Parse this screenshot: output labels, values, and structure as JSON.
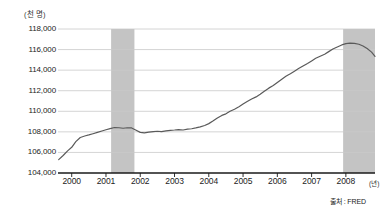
{
  "chart_data": {
    "type": "line",
    "title": "",
    "subtitle": "",
    "xlabel": "(년)",
    "ylabel": "(천 명)",
    "unit_label": "(천 명)",
    "x_unit_label": "(년)",
    "source_label": "출처 : FRED",
    "grid": true,
    "legend": false,
    "legend_position": "none",
    "xlim": [
      1999.6,
      2008.85
    ],
    "ylim": [
      104000,
      118000
    ],
    "y_ticks": [
      104000,
      106000,
      108000,
      110000,
      112000,
      114000,
      116000,
      118000
    ],
    "y_tick_labels": [
      "104,000",
      "106,000",
      "108,000",
      "110,000",
      "112,000",
      "114,000",
      "116,000",
      "118,000"
    ],
    "x_ticks": [
      2000,
      2001,
      2002,
      2003,
      2004,
      2005,
      2006,
      2007,
      2008
    ],
    "x_tick_labels": [
      "2000",
      "2001",
      "2002",
      "2003",
      "2004",
      "2005",
      "2006",
      "2007",
      "2008"
    ],
    "line_color": "#5a5a5a",
    "shade_color": "#c4c4c4",
    "grid_color": "#c9c9c9",
    "axis_color": "#1a1a1a",
    "series": [
      {
        "name": "Total nonfarm payroll employment",
        "x": [
          1999.62,
          1999.75,
          1999.88,
          2000.0,
          2000.12,
          2000.25,
          2000.38,
          2000.5,
          2000.62,
          2000.75,
          2000.88,
          2001.0,
          2001.12,
          2001.25,
          2001.38,
          2001.5,
          2001.62,
          2001.75,
          2001.88,
          2002.0,
          2002.12,
          2002.25,
          2002.38,
          2002.5,
          2002.62,
          2002.75,
          2002.88,
          2003.0,
          2003.12,
          2003.25,
          2003.38,
          2003.5,
          2003.62,
          2003.75,
          2003.88,
          2004.0,
          2004.12,
          2004.25,
          2004.38,
          2004.5,
          2004.62,
          2004.75,
          2004.88,
          2005.0,
          2005.12,
          2005.25,
          2005.38,
          2005.5,
          2005.62,
          2005.75,
          2005.88,
          2006.0,
          2006.12,
          2006.25,
          2006.38,
          2006.5,
          2006.62,
          2006.75,
          2006.88,
          2007.0,
          2007.12,
          2007.25,
          2007.38,
          2007.5,
          2007.62,
          2007.75,
          2007.88,
          2008.0,
          2008.12,
          2008.25,
          2008.38,
          2008.5,
          2008.62,
          2008.75,
          2008.85
        ],
        "values": [
          105300,
          105700,
          106150,
          106500,
          107050,
          107450,
          107600,
          107700,
          107820,
          107950,
          108080,
          108200,
          108320,
          108420,
          108400,
          108350,
          108400,
          108380,
          108150,
          107950,
          107900,
          107980,
          108030,
          108060,
          108020,
          108100,
          108150,
          108180,
          108220,
          108180,
          108260,
          108300,
          108380,
          108480,
          108620,
          108800,
          109050,
          109350,
          109600,
          109750,
          110000,
          110200,
          110450,
          110700,
          110950,
          111200,
          111400,
          111650,
          111950,
          112250,
          112500,
          112800,
          113100,
          113400,
          113650,
          113900,
          114150,
          114400,
          114650,
          114900,
          115150,
          115350,
          115550,
          115800,
          116050,
          116250,
          116450,
          116580,
          116620,
          116600,
          116520,
          116350,
          116100,
          115750,
          115350
        ]
      }
    ],
    "shaded_regions": [
      {
        "label": "recession-2001",
        "x_start": 2001.15,
        "x_end": 2001.83
      },
      {
        "label": "recession-2008",
        "x_start": 2007.92,
        "x_end": 2008.85
      }
    ]
  }
}
